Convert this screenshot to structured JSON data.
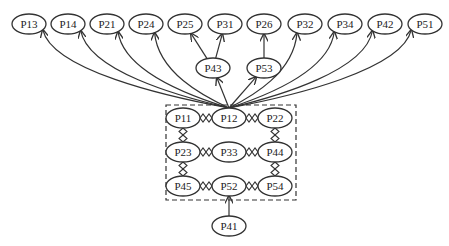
{
  "diagram": {
    "type": "directed-graph",
    "colors": {
      "stroke": "#333333",
      "background": "#ffffff",
      "text": "#222222"
    },
    "source_hub": "P12",
    "nodes": [
      {
        "id": "P13",
        "label": "P13",
        "x": 29,
        "y": 24
      },
      {
        "id": "P14",
        "label": "P14",
        "x": 68,
        "y": 24
      },
      {
        "id": "P21",
        "label": "P21",
        "x": 107,
        "y": 24
      },
      {
        "id": "P24",
        "label": "P24",
        "x": 146,
        "y": 24
      },
      {
        "id": "P25",
        "label": "P25",
        "x": 185,
        "y": 24
      },
      {
        "id": "P31",
        "label": "P31",
        "x": 225,
        "y": 24
      },
      {
        "id": "P26",
        "label": "P26",
        "x": 264,
        "y": 24
      },
      {
        "id": "P32",
        "label": "P32",
        "x": 305,
        "y": 24
      },
      {
        "id": "P34",
        "label": "P34",
        "x": 345,
        "y": 24
      },
      {
        "id": "P42",
        "label": "P42",
        "x": 385,
        "y": 24
      },
      {
        "id": "P51",
        "label": "P51",
        "x": 425,
        "y": 24
      },
      {
        "id": "P43",
        "label": "P43",
        "x": 213,
        "y": 68
      },
      {
        "id": "P53",
        "label": "P53",
        "x": 264,
        "y": 68
      },
      {
        "id": "P11",
        "label": "P11",
        "x": 183,
        "y": 118
      },
      {
        "id": "P12",
        "label": "P12",
        "x": 229,
        "y": 118
      },
      {
        "id": "P22",
        "label": "P22",
        "x": 275,
        "y": 118
      },
      {
        "id": "P23",
        "label": "P23",
        "x": 183,
        "y": 152
      },
      {
        "id": "P33",
        "label": "P33",
        "x": 229,
        "y": 152
      },
      {
        "id": "P44",
        "label": "P44",
        "x": 275,
        "y": 152
      },
      {
        "id": "P45",
        "label": "P45",
        "x": 183,
        "y": 186
      },
      {
        "id": "P52",
        "label": "P52",
        "x": 229,
        "y": 186
      },
      {
        "id": "P54",
        "label": "P54",
        "x": 275,
        "y": 186
      },
      {
        "id": "P41",
        "label": "P41",
        "x": 229,
        "y": 226
      }
    ],
    "directed_edges": [
      {
        "from": "P12",
        "to": "P13"
      },
      {
        "from": "P12",
        "to": "P14"
      },
      {
        "from": "P12",
        "to": "P21"
      },
      {
        "from": "P12",
        "to": "P24"
      },
      {
        "from": "P12",
        "to": "P43"
      },
      {
        "from": "P43",
        "to": "P25"
      },
      {
        "from": "P43",
        "to": "P31"
      },
      {
        "from": "P12",
        "to": "P53"
      },
      {
        "from": "P53",
        "to": "P26"
      },
      {
        "from": "P12",
        "to": "P32"
      },
      {
        "from": "P12",
        "to": "P34"
      },
      {
        "from": "P12",
        "to": "P42"
      },
      {
        "from": "P12",
        "to": "P51"
      },
      {
        "from": "P41",
        "to": "P52"
      }
    ],
    "diamond_links": [
      {
        "a": "P11",
        "b": "P12"
      },
      {
        "a": "P12",
        "b": "P22"
      },
      {
        "a": "P23",
        "b": "P33"
      },
      {
        "a": "P33",
        "b": "P44"
      },
      {
        "a": "P45",
        "b": "P52"
      },
      {
        "a": "P52",
        "b": "P54"
      },
      {
        "a": "P11",
        "b": "P23"
      },
      {
        "a": "P23",
        "b": "P45"
      },
      {
        "a": "P22",
        "b": "P44"
      },
      {
        "a": "P44",
        "b": "P54"
      }
    ],
    "group_box": {
      "style": "dashed",
      "x": 166,
      "y": 105,
      "width": 130,
      "height": 95,
      "members": [
        "P11",
        "P12",
        "P22",
        "P23",
        "P33",
        "P44",
        "P45",
        "P52",
        "P54"
      ]
    }
  }
}
